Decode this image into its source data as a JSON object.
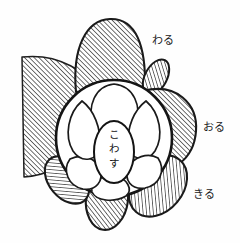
{
  "figure": {
    "background_color": "#fefefe",
    "ink_color": "#1a1a1a",
    "hatch_color": "#2b2b2b",
    "center_label": {
      "text": "こわす",
      "chars": [
        "こ",
        "わ",
        "す"
      ],
      "orientation": "vertical"
    },
    "labels": [
      {
        "id": "waru",
        "text": "わる",
        "position": "top-right",
        "x": 152,
        "y": 44
      },
      {
        "id": "oru",
        "text": "おる",
        "position": "right",
        "x": 203,
        "y": 131
      },
      {
        "id": "kiru",
        "text": "きる",
        "position": "bottom-right",
        "x": 193,
        "y": 198
      }
    ],
    "regions": [
      {
        "id": "left-fan",
        "fill": "hatched",
        "label": ""
      },
      {
        "id": "top-petal",
        "fill": "hatched",
        "label": "わる"
      },
      {
        "id": "upper-right-small-petal",
        "fill": "hatched",
        "label": ""
      },
      {
        "id": "right-crescent",
        "fill": "hatched",
        "label": "おる"
      },
      {
        "id": "bottom-right-petal",
        "fill": "hatched",
        "label": "きる"
      },
      {
        "id": "bottom-center-petal",
        "fill": "hatched",
        "label": ""
      },
      {
        "id": "bottom-left-petal",
        "fill": "hatched",
        "label": ""
      },
      {
        "id": "main-circle",
        "fill": "white",
        "label": ""
      },
      {
        "id": "inner-lobe-top",
        "fill": "white",
        "label": ""
      },
      {
        "id": "inner-lobe-upper-right",
        "fill": "white",
        "label": ""
      },
      {
        "id": "inner-lobe-lower-right",
        "fill": "white",
        "label": ""
      },
      {
        "id": "inner-lobe-bottom",
        "fill": "white",
        "label": ""
      },
      {
        "id": "inner-lobe-lower-left",
        "fill": "white",
        "label": ""
      },
      {
        "id": "inner-lobe-upper-left",
        "fill": "white",
        "label": ""
      },
      {
        "id": "center-ellipse",
        "fill": "white",
        "label": "こわす"
      }
    ]
  }
}
